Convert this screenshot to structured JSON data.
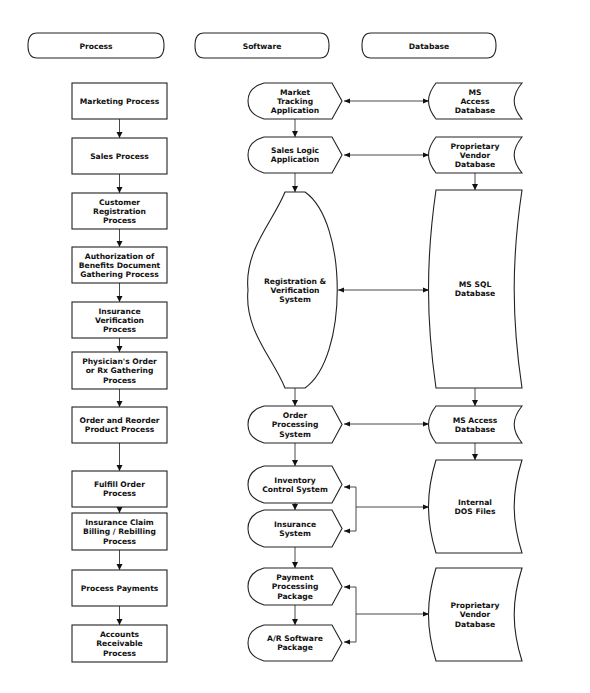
{
  "headers": [
    {
      "id": "process",
      "label": "Process",
      "x": 28,
      "y": 33,
      "w": 136,
      "h": 25
    },
    {
      "id": "software",
      "label": "Software",
      "x": 195,
      "y": 33,
      "w": 134,
      "h": 25
    },
    {
      "id": "database",
      "label": "Database",
      "x": 362,
      "y": 33,
      "w": 134,
      "h": 25
    }
  ],
  "process": [
    {
      "id": "marketing",
      "lines": [
        "Marketing  Process"
      ],
      "y": 83,
      "h": 36
    },
    {
      "id": "sales",
      "lines": [
        "Sales  Process"
      ],
      "y": 138,
      "h": 36
    },
    {
      "id": "customer-registration",
      "lines": [
        "Customer",
        "Registration",
        "Process"
      ],
      "y": 193,
      "h": 36
    },
    {
      "id": "authorization-benefits",
      "lines": [
        "Authorization  of",
        "Benefits  Document",
        "Gathering  Process"
      ],
      "y": 247,
      "h": 36
    },
    {
      "id": "insurance-verification",
      "lines": [
        "Insurance",
        "Verification",
        "Process"
      ],
      "y": 302,
      "h": 36
    },
    {
      "id": "physicians-order",
      "lines": [
        "Physician's  Order",
        "or  Rx  Gathering",
        "Process"
      ],
      "y": 352,
      "h": 37
    },
    {
      "id": "order-reorder",
      "lines": [
        "Order  and  Reorder",
        "Product  Process"
      ],
      "y": 407,
      "h": 36
    },
    {
      "id": "fulfill-order",
      "lines": [
        "Fulfill  Order",
        "Process"
      ],
      "y": 471,
      "h": 36
    },
    {
      "id": "insurance-claim",
      "lines": [
        "Insurance  Claim",
        "Billing  /  Rebilling",
        "Process"
      ],
      "y": 513,
      "h": 37
    },
    {
      "id": "process-payments",
      "lines": [
        "Process  Payments"
      ],
      "y": 570,
      "h": 36
    },
    {
      "id": "accounts-receivable",
      "lines": [
        "Accounts",
        "Receivable",
        "Process"
      ],
      "y": 625,
      "h": 37
    }
  ],
  "software": [
    {
      "id": "market-tracking",
      "lines": [
        "Market",
        "Tracking",
        "Application"
      ],
      "y": 83,
      "h": 36,
      "shape": "display"
    },
    {
      "id": "sales-logic",
      "lines": [
        "Sales  Logic",
        "Application"
      ],
      "y": 137,
      "h": 36,
      "shape": "display"
    },
    {
      "id": "registration-verification",
      "lines": [
        "Registration  &",
        "Verification",
        "System"
      ],
      "y": 192,
      "h": 196,
      "shape": "oval"
    },
    {
      "id": "order-processing",
      "lines": [
        "Order",
        "Processing",
        "System"
      ],
      "y": 406,
      "h": 37,
      "shape": "display"
    },
    {
      "id": "inventory-control",
      "lines": [
        "Inventory",
        "Control  System"
      ],
      "y": 466,
      "h": 37,
      "shape": "display"
    },
    {
      "id": "insurance-system",
      "lines": [
        "Insurance",
        "System"
      ],
      "y": 510,
      "h": 37,
      "shape": "display"
    },
    {
      "id": "payment-processing",
      "lines": [
        "Payment",
        "Processing",
        "Package"
      ],
      "y": 568,
      "h": 37,
      "shape": "display"
    },
    {
      "id": "ar-software",
      "lines": [
        "A/R  Software",
        "Package"
      ],
      "y": 625,
      "h": 36,
      "shape": "display"
    }
  ],
  "database": [
    {
      "id": "ms-access-1",
      "lines": [
        "MS",
        "Access",
        "Database"
      ],
      "y": 83,
      "h": 36
    },
    {
      "id": "proprietary-vendor-1",
      "lines": [
        "Proprietary",
        "Vendor",
        "Database"
      ],
      "y": 137,
      "h": 36
    },
    {
      "id": "ms-sql",
      "lines": [
        "MS  SQL",
        "Database"
      ],
      "y": 190,
      "h": 198
    },
    {
      "id": "ms-access-2",
      "lines": [
        "MS  Access",
        "Database"
      ],
      "y": 406,
      "h": 37
    },
    {
      "id": "internal-dos-files",
      "lines": [
        "Internal",
        "DOS  Files"
      ],
      "y": 460,
      "h": 93
    },
    {
      "id": "proprietary-vendor-2",
      "lines": [
        "Proprietary",
        "Vendor",
        "Database"
      ],
      "y": 568,
      "h": 93
    }
  ],
  "links": [
    {
      "from": "market-tracking",
      "to": "ms-access-1",
      "y": 101,
      "type": "bidirectional"
    },
    {
      "from": "sales-logic",
      "to": "proprietary-vendor-1",
      "y": 155,
      "type": "bidirectional"
    },
    {
      "from": "registration-verification",
      "to": "ms-sql",
      "y": 290,
      "type": "bidirectional"
    },
    {
      "from": "order-processing",
      "to": "ms-access-2",
      "y": 424,
      "type": "bidirectional"
    },
    {
      "from": "internal-dos-files",
      "to": [
        "inventory-control",
        "insurance-system"
      ],
      "ys": [
        487,
        531
      ],
      "y": 507,
      "type": "fork"
    },
    {
      "from": "proprietary-vendor-2",
      "to": [
        "payment-processing",
        "ar-software"
      ],
      "ys": [
        587,
        642
      ],
      "y": 614,
      "type": "fork"
    }
  ],
  "colors": {
    "stroke": "#222222",
    "fill": "#ffffff",
    "text": "#111111"
  }
}
